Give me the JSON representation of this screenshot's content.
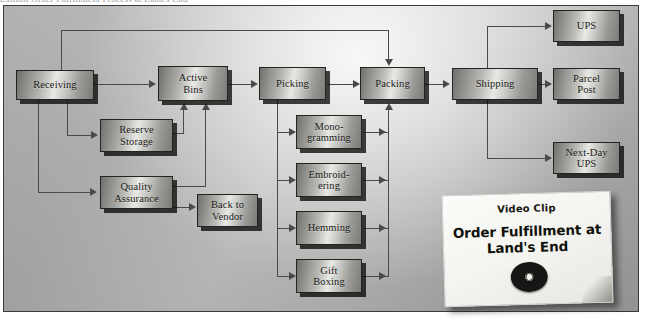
{
  "page": {
    "top_partial_text": "Exhibit    Order Fulfillment Process at Land's End"
  },
  "diagram": {
    "accent_color": "#4a4a4a",
    "node_border_color": "#23231f",
    "background_color": "#b6b6b6",
    "nodes": [
      {
        "id": "receiving",
        "label": "Receiving"
      },
      {
        "id": "reserve-storage",
        "label": "Reserve\nStorage",
        "line1": "Reserve",
        "line2": "Storage"
      },
      {
        "id": "quality-assurance",
        "label": "Quality\nAssurance",
        "line1": "Quality",
        "line2": "Assurance"
      },
      {
        "id": "back-to-vendor",
        "label": "Back to\nVendor",
        "line1": "Back to",
        "line2": "Vendor"
      },
      {
        "id": "active-bins",
        "label": "Active\nBins",
        "line1": "Active",
        "line2": "Bins"
      },
      {
        "id": "picking",
        "label": "Picking"
      },
      {
        "id": "monogramming",
        "label": "Mono-\ngramming",
        "line1": "Mono-",
        "line2": "gramming"
      },
      {
        "id": "embroidering",
        "label": "Embroid-\nering",
        "line1": "Embroid-",
        "line2": "ering"
      },
      {
        "id": "hemming",
        "label": "Hemming"
      },
      {
        "id": "gift-boxing",
        "label": "Gift\nBoxing",
        "line1": "Gift",
        "line2": "Boxing"
      },
      {
        "id": "packing",
        "label": "Packing"
      },
      {
        "id": "shipping",
        "label": "Shipping"
      },
      {
        "id": "ups",
        "label": "UPS"
      },
      {
        "id": "parcel-post",
        "label": "Parcel\nPost",
        "line1": "Parcel",
        "line2": "Post"
      },
      {
        "id": "next-day-ups",
        "label": "Next-Day\nUPS",
        "line1": "Next-Day",
        "line2": "UPS"
      }
    ]
  },
  "video_clip": {
    "kicker": "Video Clip",
    "title_line1": "Order Fulfillment at",
    "title_line2": "Land's End",
    "media_icon": "compact-disc-icon"
  }
}
